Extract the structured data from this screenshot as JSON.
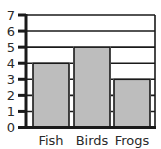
{
  "chart_data": {
    "type": "bar",
    "title": "",
    "xlabel": "",
    "ylabel": "",
    "categories": [
      "Fish",
      "Birds",
      "Frogs"
    ],
    "values": [
      4,
      5,
      3
    ],
    "ylim": [
      0,
      7
    ],
    "yticks": [
      0,
      1,
      2,
      3,
      4,
      5,
      6,
      7
    ],
    "grid": true,
    "legend": null,
    "colors": {
      "bar_fill": "#bdbdbd",
      "bar_stroke": "#1a1a1a",
      "grid": "#1a1a1a",
      "axis": "#1a1a1a",
      "text": "#2a2a2a",
      "background": "#ffffff"
    }
  }
}
